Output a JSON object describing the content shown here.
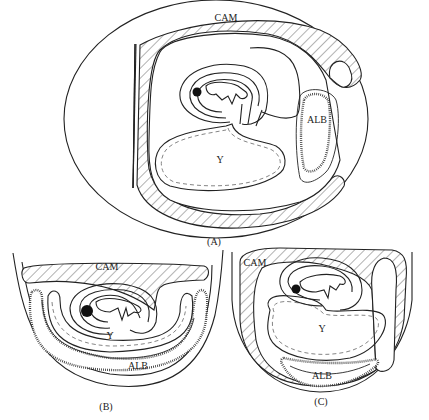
{
  "figure": {
    "panels": [
      {
        "id": "A",
        "caption": "(A)",
        "labels": {
          "cam": "CAM",
          "albumen": "ALB",
          "yolk": "Y"
        }
      },
      {
        "id": "B",
        "caption": "(B)",
        "labels": {
          "cam": "CAM",
          "albumen": "ALB",
          "yolk": "Y"
        }
      },
      {
        "id": "C",
        "caption": "(C)",
        "labels": {
          "cam": "CAM",
          "albumen": "ALB",
          "yolk": "Y"
        }
      }
    ]
  },
  "colors": {
    "line": "#222222",
    "background": "#ffffff",
    "dashed": "#777777"
  }
}
